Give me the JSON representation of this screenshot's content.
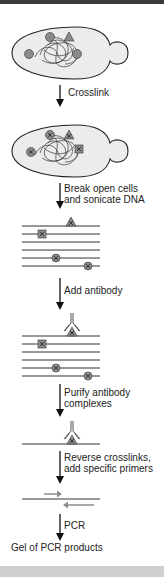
{
  "steps": [
    {
      "label": "Crosslink"
    },
    {
      "label": "Break open cells\nand sonicate DNA"
    },
    {
      "label": "Add antibody"
    },
    {
      "label": "Purify antibody\ncomplexes"
    },
    {
      "label": "Reverse crosslinks,\nadd specific primers"
    },
    {
      "label": "PCR"
    }
  ],
  "final_label": "Gel of PCR products",
  "stages": [
    {
      "name": "yeast-cell-with-proteins",
      "proteins": [
        "circle",
        "triangle",
        "circle",
        "circle"
      ]
    },
    {
      "name": "crosslinked-yeast-cell",
      "proteins": [
        "crosslinked-circle",
        "crosslinked-triangle",
        "crosslinked-circle",
        "crosslinked-square"
      ]
    },
    {
      "name": "sonicated-dna-fragments",
      "fragment_count": 6
    },
    {
      "name": "antibody-bound-fragments",
      "fragment_count": 6
    },
    {
      "name": "purified-complex",
      "fragment_count": 1
    },
    {
      "name": "dna-with-primers",
      "primers": [
        "forward",
        "reverse"
      ]
    }
  ],
  "colors": {
    "cell_fill": "#ececec",
    "outline": "#222222",
    "protein_fill": "#8a8a8a",
    "primer": "#8c8c8c",
    "top_bar": "#3a3a3a",
    "bottom_bar": "#cfcfcf"
  }
}
